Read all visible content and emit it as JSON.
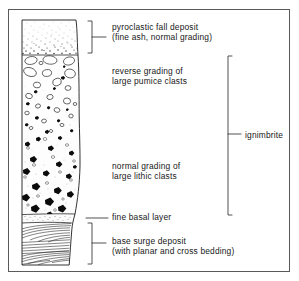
{
  "figure": {
    "type": "stratigraphic-column",
    "title_present": false,
    "frame": {
      "x": 8,
      "y": 9,
      "width": 282,
      "height": 263,
      "stroke": "#555555"
    },
    "background_color": "#ffffff",
    "ink_color": "#111111"
  },
  "column": {
    "left_x": 22,
    "right_x": 78,
    "top_y": 20,
    "bottom_y": 265,
    "fill_color": "#fcfcfc",
    "units": [
      {
        "id": "fall-deposit",
        "name": "pyroclastic fall deposit",
        "top_y": 20,
        "bottom_y": 55,
        "texture": "fine stipple, normal grading (coarser stipple downward)",
        "clast_fill": "#2a2a2a"
      },
      {
        "id": "reverse-graded-pumice",
        "name": "reverse grading of large pumice clasts",
        "top_y": 55,
        "bottom_y": 135,
        "texture": "open ellipse outlines (pumice) enlarging upward, sparse black lithics",
        "clast_outline": "#3a3a3a",
        "clast_fill": "#ffffff"
      },
      {
        "id": "normal-graded-lithics",
        "name": "normal grading of large lithic clasts",
        "top_y": 135,
        "bottom_y": 215,
        "texture": "solid black angular clasts enlarging downward, small open circles",
        "clast_fill": "#0d0d0d"
      },
      {
        "id": "fine-basal-layer",
        "name": "fine basal layer",
        "top_y": 215,
        "bottom_y": 223,
        "texture": "fine stipple, thin",
        "clast_fill": "#333333"
      },
      {
        "id": "base-surge-deposit",
        "name": "base surge deposit",
        "top_y": 223,
        "bottom_y": 265,
        "texture": "planar and cross bedding laminations",
        "clast_fill": "#222222"
      }
    ]
  },
  "labels": {
    "fall_deposit": {
      "line1": "pyroclastic fall deposit",
      "line2": "(fine ash, normal grading)",
      "x": 112,
      "y": 22
    },
    "reverse_grading": {
      "line1": "reverse grading of",
      "line2": "large pumice clasts",
      "x": 112,
      "y": 66
    },
    "normal_grading": {
      "line1": "normal grading of",
      "line2": "large lithic clasts",
      "x": 112,
      "y": 161
    },
    "fine_basal_layer": {
      "line1": "fine basal layer",
      "x": 112,
      "y": 212
    },
    "base_surge": {
      "line1": "base surge deposit",
      "line2": "(with planar and cross bedding)",
      "x": 112,
      "y": 236
    },
    "ignimbrite": {
      "line1": "ignimbrite",
      "x": 245,
      "y": 130
    }
  },
  "brackets": [
    {
      "id": "fall-deposit-bracket",
      "target": "pyroclastic fall deposit",
      "x": 92,
      "top_y": 21,
      "bottom_y": 53,
      "tick_y": 37,
      "tick_to_x": 107,
      "side": "left-facing"
    },
    {
      "id": "ignimbrite-bracket",
      "target": "ignimbrite",
      "x": 228,
      "top_y": 56,
      "bottom_y": 215,
      "tick_y": 134,
      "tick_to_x": 242,
      "side": "right-facing"
    },
    {
      "id": "fine-basal-layer-leader",
      "target": "fine basal layer",
      "x": 86,
      "tick_y": 218,
      "tick_to_x": 108,
      "side": "leader-line"
    },
    {
      "id": "base-surge-bracket",
      "target": "base surge deposit",
      "x": 92,
      "top_y": 223,
      "bottom_y": 264,
      "tick_y": 243,
      "tick_to_x": 107,
      "side": "left-facing"
    }
  ]
}
